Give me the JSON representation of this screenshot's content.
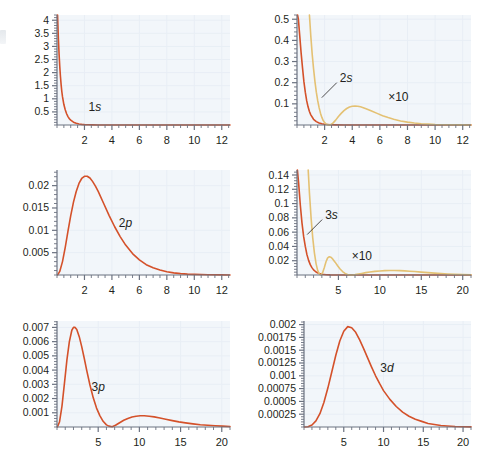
{
  "figure": {
    "type": "multi-panel-line-chart",
    "background": "#ffffff",
    "plot_background": "#f2f6fa",
    "grid_color": "#e8eef5",
    "axis_color": "#6b7280",
    "tick_label_color": "#231f20",
    "colors": {
      "red": "#d4512a",
      "tan": "#e4c173"
    },
    "panel_count": 6,
    "rows": 3,
    "cols": 2
  },
  "chart_data": [
    {
      "id": "panel-1s",
      "type": "line",
      "title": "",
      "xlabel": "",
      "ylabel": "",
      "xlim": [
        0,
        12.6
      ],
      "ylim": [
        0,
        4.2
      ],
      "xticks": [
        2,
        4,
        6,
        8,
        10,
        12
      ],
      "yticks": [
        0.5,
        1,
        1.5,
        2,
        2.5,
        3,
        3.5,
        4
      ],
      "ytick_labels": [
        "0.5",
        "1",
        "1.5",
        "2",
        "2.5",
        "3",
        "3.5",
        "4"
      ],
      "xtick_labels": [
        "2",
        "4",
        "6",
        "8",
        "10",
        "12"
      ],
      "grid": true,
      "minor_ticks_per_major": 4,
      "annotations": [
        {
          "text": "1s",
          "x": 2.3,
          "y": 0.55,
          "leader": false
        }
      ],
      "series": [
        {
          "name": "1s",
          "color": "#d4512a",
          "x": [
            0.04,
            0.1,
            0.15,
            0.2,
            0.25,
            0.3,
            0.35,
            0.4,
            0.5,
            0.6,
            0.7,
            0.8,
            0.9,
            1.0,
            1.2,
            1.4,
            1.6,
            1.8,
            2.0,
            2.3,
            2.6,
            3.0,
            3.5,
            4.0,
            5.0,
            6.0,
            7.0,
            8.0,
            9.0,
            10.0,
            11.0,
            12.0,
            12.6
          ],
          "y": [
            4.2,
            3.3,
            2.72,
            2.24,
            1.86,
            1.54,
            1.28,
            1.08,
            0.78,
            0.58,
            0.43,
            0.32,
            0.24,
            0.185,
            0.108,
            0.065,
            0.04,
            0.025,
            0.015,
            0.0076,
            0.0039,
            0.0016,
            0.00055,
            0.00019,
            2.2e-05,
            2.6e-06,
            3e-07,
            0,
            0,
            0,
            0,
            0,
            0
          ]
        }
      ]
    },
    {
      "id": "panel-2s",
      "type": "line",
      "title": "",
      "xlabel": "",
      "ylabel": "",
      "xlim": [
        0,
        12.6
      ],
      "ylim": [
        0,
        0.52
      ],
      "xticks": [
        2,
        4,
        6,
        8,
        10,
        12
      ],
      "yticks": [
        0.1,
        0.2,
        0.3,
        0.4,
        0.5
      ],
      "ytick_labels": [
        "0.1",
        "0.2",
        "0.3",
        "0.4",
        "0.5"
      ],
      "xtick_labels": [
        "2",
        "4",
        "6",
        "8",
        "10",
        "12"
      ],
      "grid": true,
      "minor_ticks_per_major": 4,
      "annotations": [
        {
          "text": "2s",
          "x": 3.1,
          "y": 0.205,
          "leader": true
        },
        {
          "text": "×10",
          "x": 6.6,
          "y": 0.115,
          "leader": false
        }
      ],
      "series": [
        {
          "name": "1s-reference",
          "color": "#d4512a",
          "x": [
            0.04,
            0.1,
            0.2,
            0.3,
            0.4,
            0.5,
            0.6,
            0.7,
            0.8,
            0.9,
            1.0,
            1.2,
            1.4,
            1.6,
            1.8,
            2.0,
            2.4,
            2.8,
            3.4,
            4.0,
            5.0,
            6.0,
            8.0,
            10.0,
            12.6
          ],
          "y": [
            0.52,
            0.5,
            0.42,
            0.34,
            0.27,
            0.205,
            0.155,
            0.115,
            0.086,
            0.064,
            0.048,
            0.027,
            0.016,
            0.0095,
            0.0057,
            0.0035,
            0.0013,
            0.0005,
            0.00011,
            2.5e-05,
            0,
            0,
            0,
            0,
            0
          ]
        },
        {
          "name": "2s-times-10",
          "color": "#e4c173",
          "x": [
            0.9,
            1.0,
            1.1,
            1.2,
            1.3,
            1.4,
            1.5,
            1.6,
            1.7,
            1.8,
            1.9,
            2.0,
            2.1,
            2.2,
            2.4,
            2.6,
            2.8,
            3.0,
            3.2,
            3.4,
            3.6,
            3.8,
            4.0,
            4.2,
            4.4,
            4.6,
            4.8,
            5.0,
            5.4,
            5.8,
            6.2,
            6.6,
            7.0,
            7.5,
            8.0,
            8.5,
            9.0,
            9.5,
            10.0,
            11.0,
            12.0,
            12.6
          ],
          "y": [
            0.52,
            0.42,
            0.335,
            0.265,
            0.205,
            0.155,
            0.115,
            0.082,
            0.056,
            0.036,
            0.021,
            0.011,
            0.005,
            0.0014,
            0.0008,
            0.009,
            0.023,
            0.04,
            0.055,
            0.068,
            0.078,
            0.085,
            0.0885,
            0.09,
            0.0885,
            0.086,
            0.082,
            0.077,
            0.066,
            0.055,
            0.044,
            0.035,
            0.027,
            0.019,
            0.0135,
            0.0092,
            0.0062,
            0.0042,
            0.0027,
            0.0012,
            0.0005,
            0.0003
          ]
        }
      ]
    },
    {
      "id": "panel-2p",
      "type": "line",
      "title": "",
      "xlabel": "",
      "ylabel": "",
      "xlim": [
        0,
        12.6
      ],
      "ylim": [
        0,
        0.0235
      ],
      "xticks": [
        2,
        4,
        6,
        8,
        10,
        12
      ],
      "yticks": [
        0.005,
        0.01,
        0.015,
        0.02
      ],
      "ytick_labels": [
        "0.005",
        "0.01",
        "0.015",
        "0.02"
      ],
      "xtick_labels": [
        "2",
        "4",
        "6",
        "8",
        "10",
        "12"
      ],
      "grid": true,
      "minor_ticks_per_major": 4,
      "annotations": [
        {
          "text": "2p",
          "x": 4.5,
          "y": 0.0108,
          "leader": false
        }
      ],
      "series": [
        {
          "name": "2p",
          "color": "#d4512a",
          "x": [
            0.05,
            0.2,
            0.4,
            0.6,
            0.8,
            1.0,
            1.2,
            1.4,
            1.6,
            1.8,
            2.0,
            2.2,
            2.4,
            2.6,
            2.8,
            3.0,
            3.4,
            3.8,
            4.2,
            4.6,
            5.0,
            5.5,
            6.0,
            6.5,
            7.0,
            7.5,
            8.0,
            8.5,
            9.0,
            9.5,
            10.0,
            11.0,
            12.0,
            12.6
          ],
          "y": [
            2e-05,
            0.0008,
            0.003,
            0.0062,
            0.0098,
            0.0133,
            0.0163,
            0.0187,
            0.0205,
            0.0216,
            0.0221,
            0.0221,
            0.0217,
            0.0209,
            0.0199,
            0.0187,
            0.016,
            0.0133,
            0.0108,
            0.0086,
            0.0067,
            0.0048,
            0.0034,
            0.0023,
            0.0016,
            0.0011,
            0.00072,
            0.00047,
            0.00031,
            0.0002,
            0.00013,
            5e-05,
            2e-05,
            1e-05
          ]
        }
      ]
    },
    {
      "id": "panel-3s",
      "type": "line",
      "title": "",
      "xlabel": "",
      "ylabel": "",
      "xlim": [
        0,
        21
      ],
      "ylim": [
        0,
        0.147
      ],
      "xticks": [
        5,
        10,
        15,
        20
      ],
      "yticks": [
        0.02,
        0.04,
        0.06,
        0.08,
        0.1,
        0.12,
        0.14
      ],
      "ytick_labels": [
        "0.02",
        "0.04",
        "0.06",
        "0.08",
        "0.1",
        "0.12",
        "0.14"
      ],
      "xtick_labels": [
        "5",
        "10",
        "15",
        "20"
      ],
      "grid": true,
      "minor_ticks_per_major": 5,
      "annotations": [
        {
          "text": "3s",
          "x": 3.4,
          "y": 0.079,
          "leader": true
        },
        {
          "text": "×10",
          "x": 6.6,
          "y": 0.021,
          "leader": false
        }
      ],
      "series": [
        {
          "name": "1s-reference",
          "color": "#d4512a",
          "x": [
            0.05,
            0.2,
            0.4,
            0.6,
            0.8,
            1.0,
            1.2,
            1.4,
            1.6,
            1.8,
            2.0,
            2.3,
            2.6,
            3.0,
            3.5,
            4.0,
            5.0,
            6.0,
            8.0,
            10.0,
            14.0,
            21.0
          ],
          "y": [
            0.147,
            0.128,
            0.098,
            0.073,
            0.054,
            0.04,
            0.0285,
            0.0205,
            0.0145,
            0.0103,
            0.0072,
            0.0042,
            0.0024,
            0.0011,
            0.0004,
            0.00014,
            2e-05,
            0,
            0,
            0,
            0,
            0
          ]
        },
        {
          "name": "3s-times-10",
          "color": "#e4c173",
          "x": [
            1.35,
            1.5,
            1.7,
            1.9,
            2.1,
            2.3,
            2.5,
            2.7,
            2.9,
            3.1,
            3.3,
            3.5,
            3.7,
            3.9,
            4.1,
            4.3,
            4.6,
            4.9,
            5.2,
            5.5,
            5.8,
            6.1,
            6.4,
            6.7,
            7.0,
            7.4,
            7.8,
            8.3,
            8.8,
            9.4,
            10.0,
            10.6,
            11.2,
            11.8,
            12.4,
            13.0,
            13.6,
            14.2,
            15.0,
            15.8,
            16.6,
            17.4,
            18.2,
            19.0,
            20.0,
            21.0
          ],
          "y": [
            0.147,
            0.115,
            0.08,
            0.052,
            0.031,
            0.016,
            0.0062,
            0.0012,
            0.0001,
            0.0035,
            0.0105,
            0.0185,
            0.024,
            0.0255,
            0.0248,
            0.0225,
            0.018,
            0.013,
            0.0085,
            0.0048,
            0.0022,
            0.0007,
            0.0,
            0.0001,
            0.0005,
            0.0013,
            0.0022,
            0.0033,
            0.0042,
            0.0051,
            0.0057,
            0.0061,
            0.0063,
            0.0063,
            0.0061,
            0.0058,
            0.0053,
            0.0048,
            0.004,
            0.0033,
            0.0026,
            0.002,
            0.0015,
            0.0011,
            0.0007,
            0.0004
          ]
        }
      ]
    },
    {
      "id": "panel-3p",
      "type": "line",
      "title": "",
      "xlabel": "",
      "ylabel": "",
      "xlim": [
        0,
        21
      ],
      "ylim": [
        0,
        0.00745
      ],
      "xticks": [
        5,
        10,
        15,
        20
      ],
      "yticks": [
        0.001,
        0.002,
        0.003,
        0.004,
        0.005,
        0.006,
        0.007
      ],
      "ytick_labels": [
        "0.001",
        "0.002",
        "0.003",
        "0.004",
        "0.005",
        "0.006",
        "0.007"
      ],
      "xtick_labels": [
        "5",
        "10",
        "15",
        "20"
      ],
      "grid": true,
      "minor_ticks_per_major": 5,
      "annotations": [
        {
          "text": "3p",
          "x": 4.2,
          "y": 0.00255,
          "leader": false
        }
      ],
      "series": [
        {
          "name": "3p",
          "color": "#d4512a",
          "x": [
            0.05,
            0.3,
            0.6,
            0.9,
            1.2,
            1.5,
            1.8,
            2.0,
            2.2,
            2.4,
            2.7,
            3.0,
            3.3,
            3.6,
            4.0,
            4.4,
            4.8,
            5.2,
            5.6,
            6.0,
            6.3,
            6.7,
            7.1,
            7.6,
            8.1,
            8.6,
            9.1,
            9.6,
            10.1,
            10.6,
            11.2,
            11.8,
            12.5,
            13.2,
            14.0,
            14.8,
            15.6,
            16.5,
            17.4,
            18.3,
            19.2,
            20.1,
            21.0
          ],
          "y": [
            1e-05,
            0.00035,
            0.00145,
            0.00305,
            0.0047,
            0.006,
            0.0068,
            0.007,
            0.007,
            0.00685,
            0.00635,
            0.00565,
            0.00485,
            0.004,
            0.00295,
            0.00205,
            0.00133,
            0.0008,
            0.0004,
            0.00015,
            6e-05,
            2e-05,
            0.00012,
            0.0003,
            0.00047,
            0.0006,
            0.0007,
            0.00076,
            0.00079,
            0.00079,
            0.00076,
            0.00071,
            0.00063,
            0.00055,
            0.00045,
            0.00036,
            0.00029,
            0.00022,
            0.00016,
            0.00012,
            9e-05,
            6e-05,
            4e-05
          ]
        }
      ]
    },
    {
      "id": "panel-3d",
      "type": "line",
      "title": "",
      "xlabel": "",
      "ylabel": "",
      "xlim": [
        0,
        21
      ],
      "ylim": [
        0,
        0.00207
      ],
      "xticks": [
        5,
        10,
        15,
        20
      ],
      "yticks": [
        0.00025,
        0.0005,
        0.00075,
        0.001,
        0.00125,
        0.0015,
        0.00175,
        0.002
      ],
      "ytick_labels": [
        "0.00025",
        "0.0005",
        "0.00075",
        "0.001",
        "0.00125",
        "0.0015",
        "0.00175",
        "0.002"
      ],
      "xtick_labels": [
        "5",
        "10",
        "15",
        "20"
      ],
      "grid": true,
      "minor_ticks_per_major": 5,
      "annotations": [
        {
          "text": "3d",
          "x": 9.6,
          "y": 0.00108,
          "leader": false
        }
      ],
      "series": [
        {
          "name": "3d",
          "color": "#d4512a",
          "x": [
            0.05,
            0.5,
            1.0,
            1.5,
            2.0,
            2.5,
            3.0,
            3.5,
            4.0,
            4.5,
            5.0,
            5.5,
            6.0,
            6.5,
            7.0,
            7.5,
            8.0,
            8.5,
            9.0,
            9.5,
            10.0,
            10.8,
            11.6,
            12.4,
            13.2,
            14.0,
            14.8,
            15.6,
            16.4,
            17.2,
            18.0,
            19.0,
            20.0,
            21.0
          ],
          "y": [
            1e-07,
            6e-06,
            4e-05,
            0.00012,
            0.00026,
            0.00048,
            0.00076,
            0.00108,
            0.0014,
            0.00168,
            0.00187,
            0.00196,
            0.00194,
            0.00185,
            0.0017,
            0.00153,
            0.00135,
            0.00117,
            0.001,
            0.00085,
            0.00071,
            0.00054,
            0.0004,
            0.00029,
            0.00021,
            0.00015,
            0.00011,
            7e-05,
            5e-05,
            3e-05,
            2e-05,
            1e-05,
            6e-06,
            3e-06
          ]
        }
      ]
    }
  ]
}
